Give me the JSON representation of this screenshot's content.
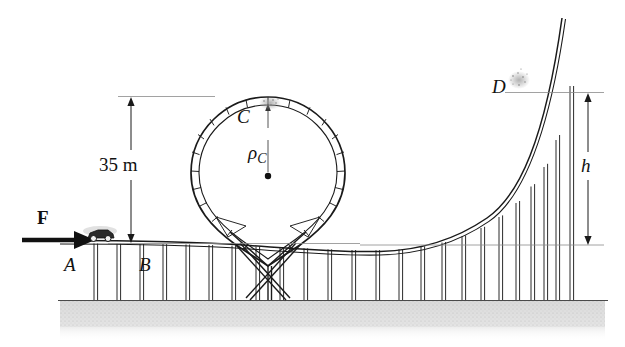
{
  "figure": {
    "background_color": "#ffffff",
    "line_color": "#1a1a1a",
    "ground_color": "#c8c8c8",
    "reference_line_color": "#888888"
  },
  "labels": {
    "point_a": "A",
    "point_b": "B",
    "point_c": "C",
    "point_d": "D",
    "force": "F",
    "height_h": "h",
    "loop_height": "35 m",
    "radius_symbol": "ρ",
    "radius_subscript": "C"
  },
  "dimensions": {
    "loop_height_value": 35,
    "loop_height_unit": "m",
    "loop_height_text": "35 m",
    "hill_height_symbol": "h",
    "loop_radius_symbol": "ρ_C"
  },
  "geometry": {
    "ground_y": 300,
    "track_level_y": 245,
    "loop_top_y": 97,
    "loop_center_x": 268,
    "loop_center_y": 176,
    "loop_radius": 72,
    "dim_35m_x": 131,
    "dim_35m_top_y": 97,
    "dim_35m_bottom_y": 243,
    "dim_h_x": 588,
    "dim_h_top_y": 93,
    "dim_h_bottom_y": 245,
    "track_end_x": 562,
    "track_end_y": 18,
    "force_arrow_x1": 22,
    "force_arrow_x2": 92,
    "force_arrow_y": 240,
    "car_x": 97,
    "car_y": 235
  }
}
